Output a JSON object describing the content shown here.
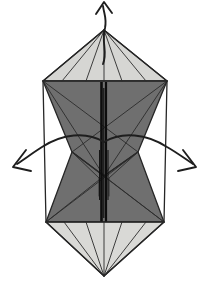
{
  "figure": {
    "title": "Origami fold step diagram",
    "canvas": {
      "width": 210,
      "height": 290,
      "background": "#ffffff"
    }
  },
  "palette": {
    "paper_light": "#d6d6d3",
    "paper_light_alt": "#dedeDB",
    "paper_dark": "#6f6f6f",
    "paper_dark_alt": "#6a6a6a",
    "outline": "#262626",
    "fold_line": "#2b2b2b",
    "fold_line_thin": "#5a5a5a",
    "spine_black": "#0d0d0d",
    "arrow": "#1e1e1e",
    "background": "#ffffff"
  },
  "geometry": {
    "apex_top": {
      "x": 104,
      "y": 30
    },
    "apex_bottom": {
      "x": 104,
      "y": 276
    },
    "shoulder_left": {
      "x": 43,
      "y": 81
    },
    "shoulder_right": {
      "x": 167,
      "y": 81
    },
    "hip_left": {
      "x": 46,
      "y": 222
    },
    "hip_right": {
      "x": 164,
      "y": 222
    },
    "waist_left": {
      "x": 72,
      "y": 152
    },
    "waist_right": {
      "x": 138,
      "y": 152
    },
    "light_top_base_y": 81,
    "light_bottom_base_y": 222,
    "spine_top_y": 82,
    "spine_bottom_y": 222
  },
  "shapes": [
    {
      "name": "top-light-panel",
      "fill": "#d6d6d3",
      "points": "104,30 167,81 43,81"
    },
    {
      "name": "upper-dark-panel",
      "fill": "#6f6f6f",
      "points": "43,81 167,81 138,152 104,176 72,152"
    },
    {
      "name": "lower-dark-panel",
      "fill": "#6f6f6f",
      "points": "72,152 104,176 138,152 164,222 46,222"
    },
    {
      "name": "bottom-light-panel",
      "fill": "#d9d9d6",
      "points": "46,222 164,222 104,276"
    }
  ],
  "fold_lines": [
    {
      "name": "top-left-rib-outer",
      "d": "M104,30 L62,81"
    },
    {
      "name": "top-left-rib-inner",
      "d": "M104,30 L86,81"
    },
    {
      "name": "top-right-rib-inner",
      "d": "M104,30 L122,81"
    },
    {
      "name": "top-right-rib-outer",
      "d": "M104,30 L146,81"
    },
    {
      "name": "top-center-axis",
      "d": "M104,30 L104,81"
    },
    {
      "name": "upper-dark-left-diagonal",
      "d": "M43,81 L138,152"
    },
    {
      "name": "upper-dark-right-diagonal",
      "d": "M167,81 L72,152"
    },
    {
      "name": "upper-left-crease",
      "d": "M43,81 L104,176"
    },
    {
      "name": "upper-right-crease",
      "d": "M167,81 L104,176"
    },
    {
      "name": "lower-dark-left-diagonal",
      "d": "M72,152 L164,222"
    },
    {
      "name": "lower-dark-right-diagonal",
      "d": "M138,152 L46,222"
    },
    {
      "name": "lower-left-crease",
      "d": "M46,222 L104,176"
    },
    {
      "name": "lower-right-crease",
      "d": "M164,222 L104,176"
    },
    {
      "name": "bottom-left-rib-outer",
      "d": "M104,276 L64,222"
    },
    {
      "name": "bottom-left-rib-inner",
      "d": "M104,276 L86,222"
    },
    {
      "name": "bottom-right-rib-inner",
      "d": "M104,276 L122,222"
    },
    {
      "name": "bottom-right-rib-outer",
      "d": "M104,276 L146,222"
    },
    {
      "name": "bottom-center-axis",
      "d": "M104,276 L104,222"
    },
    {
      "name": "waist-left-notch",
      "d": "M72,152 L99,178 L99,196"
    },
    {
      "name": "waist-right-notch",
      "d": "M138,152 L109,178 L109,196"
    }
  ],
  "arrows": [
    {
      "name": "arrow-up",
      "direction": "up",
      "tail": "M103,64 C108,52 101,42 105,28 C107,18 104,14 103,6",
      "head": "M96,14 L104,2 L112,13",
      "label": ""
    },
    {
      "name": "arrow-left",
      "direction": "down-left",
      "tail": "M104,142 C86,131 62,134 42,147 C34,152 26,158 17,164",
      "head": "M26,150 L13,167 L31,171",
      "label": ""
    },
    {
      "name": "arrow-right",
      "direction": "down-right",
      "tail": "M104,142 C122,131 147,134 167,147 C176,152 184,158 193,164",
      "head": "M183,150 L196,167 L178,171",
      "label": ""
    }
  ],
  "spine": {
    "name": "center-spine",
    "segments": [
      {
        "x": 101.5,
        "y1": 82,
        "y2": 222,
        "width": 2.6,
        "color": "#0d0d0d"
      },
      {
        "x": 106.0,
        "y1": 82,
        "y2": 222,
        "width": 2.2,
        "color": "#0d0d0d"
      },
      {
        "x": 103.8,
        "y1": 88,
        "y2": 218,
        "width": 1.2,
        "color": "#2a2a2a"
      },
      {
        "x": 99.6,
        "y1": 150,
        "y2": 200,
        "width": 1.0,
        "color": "#1a1a1a"
      },
      {
        "x": 108.0,
        "y1": 150,
        "y2": 200,
        "width": 1.0,
        "color": "#1a1a1a"
      }
    ]
  }
}
